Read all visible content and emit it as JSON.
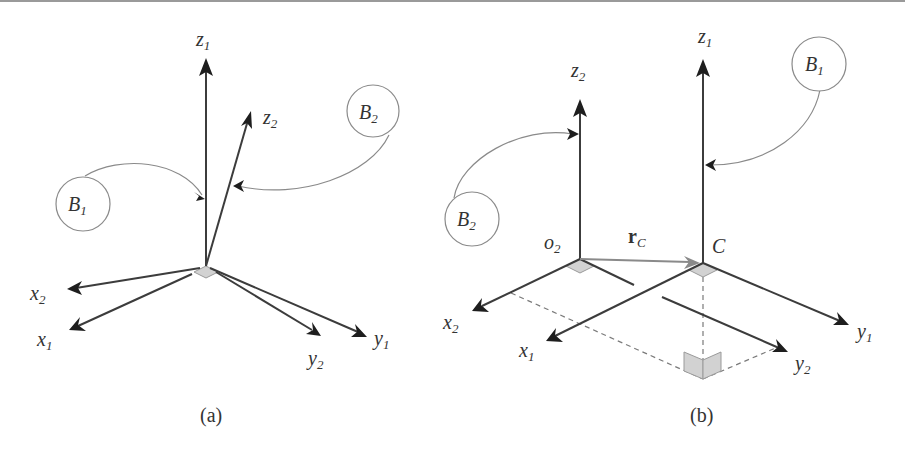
{
  "figure": {
    "panels": [
      {
        "caption": "(a)",
        "axes": {
          "z1": {
            "base": "z",
            "sub": "1"
          },
          "z2": {
            "base": "z",
            "sub": "2"
          },
          "x1": {
            "base": "x",
            "sub": "1"
          },
          "x2": {
            "base": "x",
            "sub": "2"
          },
          "y1": {
            "base": "y",
            "sub": "1"
          },
          "y2": {
            "base": "y",
            "sub": "2"
          }
        },
        "bodies": [
          {
            "base": "B",
            "sub": "1"
          },
          {
            "base": "B",
            "sub": "2"
          }
        ]
      },
      {
        "caption": "(b)",
        "axes": {
          "z1": {
            "base": "z",
            "sub": "1"
          },
          "z2": {
            "base": "z",
            "sub": "2"
          },
          "x1": {
            "base": "x",
            "sub": "1"
          },
          "x2": {
            "base": "x",
            "sub": "2"
          },
          "y1": {
            "base": "y",
            "sub": "1"
          },
          "y2": {
            "base": "y",
            "sub": "2"
          }
        },
        "bodies": [
          {
            "base": "B",
            "sub": "1"
          },
          {
            "base": "B",
            "sub": "2"
          }
        ],
        "points": {
          "o2": {
            "base": "o",
            "sub": "2"
          },
          "C": {
            "base": "C"
          }
        },
        "vector": {
          "base": "r",
          "sub": "C"
        }
      }
    ]
  }
}
